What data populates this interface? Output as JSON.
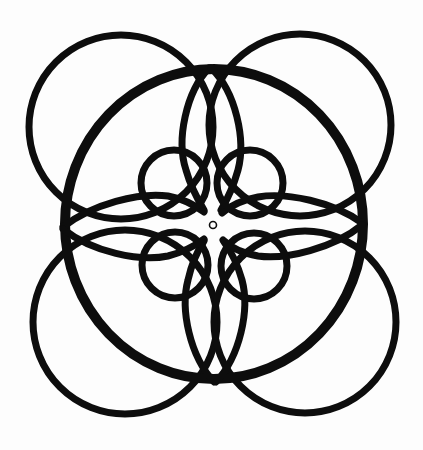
{
  "diagram": {
    "title": "Concentric interlocking circles rosette",
    "background_color": "#fdfdfd",
    "stroke_color": "#0d0d0d",
    "outer_circles": [
      {
        "name": "top-left",
        "cx": 121,
        "cy": 127,
        "r": 92,
        "stroke_width": 7
      },
      {
        "name": "top-right",
        "cx": 300,
        "cy": 125,
        "r": 91,
        "stroke_width": 7
      },
      {
        "name": "bottom-left",
        "cx": 125,
        "cy": 322,
        "r": 92,
        "stroke_width": 7
      },
      {
        "name": "bottom-right",
        "cx": 305,
        "cy": 322,
        "r": 91,
        "stroke_width": 7
      }
    ],
    "central_ring": {
      "cx": 214,
      "cy": 224,
      "rx": 149,
      "ry": 155,
      "stroke_width": 10
    },
    "small_circles": [
      {
        "name": "top-left",
        "cx": 174,
        "cy": 183,
        "r": 33,
        "stroke_width": 7
      },
      {
        "name": "top-right",
        "cx": 250,
        "cy": 183,
        "r": 33,
        "stroke_width": 7
      },
      {
        "name": "bottom-left",
        "cx": 175,
        "cy": 265,
        "r": 33,
        "stroke_width": 7
      },
      {
        "name": "bottom-right",
        "cx": 254,
        "cy": 266,
        "r": 33,
        "stroke_width": 7
      }
    ],
    "center_dot": {
      "cx": 213,
      "cy": 225,
      "r": 3.5,
      "stroke_width": 1.6
    },
    "petal_arcs_count": 8
  }
}
